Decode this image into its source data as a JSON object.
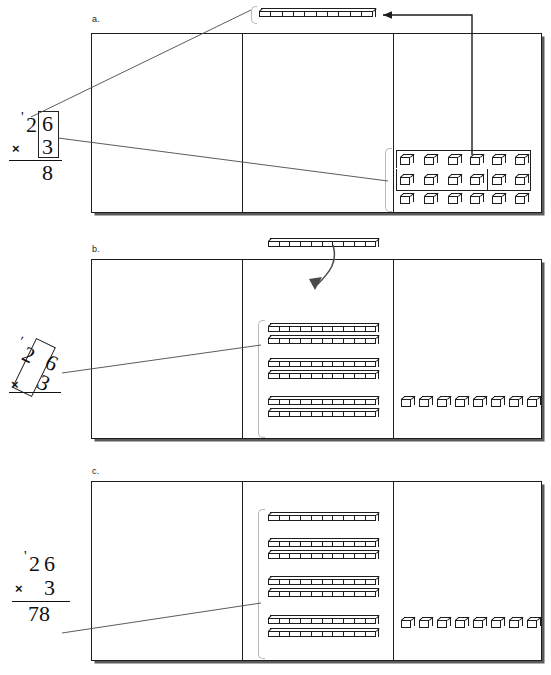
{
  "figure": {
    "ink_color": "#1d1d1d",
    "shadow_color": "#5b5b5b",
    "brace_color": "#b9b9b9"
  },
  "panels": [
    {
      "id": "a",
      "label": "a.",
      "math": {
        "regroup_mark": "'",
        "tens_digit": "2",
        "ones_digit": "6",
        "operator": "×",
        "multiplier": "3",
        "product": "8",
        "highlight": "ones-column-box"
      },
      "mat": {
        "columns": [
          "hundreds",
          "tens",
          "ones"
        ],
        "hundreds_contents": [],
        "tens_contents": [],
        "ones_contents": {
          "type": "cubes",
          "rows": 3,
          "per_row": 6,
          "total": 18,
          "regrouped_ring_count": 10
        }
      },
      "regrouped_rod": {
        "type": "rod",
        "units": 10,
        "position": "above-mat-tens-column",
        "label": "ten ones traded for one ten"
      },
      "arrow": {
        "kind": "elbow-arrow",
        "direction": "left",
        "meaning": "10 ones regrouped to 1 ten"
      }
    },
    {
      "id": "b",
      "label": "b.",
      "math": {
        "regroup_mark": "'",
        "tens_digit": "2",
        "ones_digit": "6",
        "operator": "×",
        "multiplier": "3",
        "product": "",
        "highlight": "tens-column-tilted-box"
      },
      "mat": {
        "columns": [
          "hundreds",
          "tens",
          "ones"
        ],
        "hundreds_contents": [],
        "tens_contents": {
          "type": "rods",
          "groups": [
            2,
            2,
            2
          ],
          "total": 6,
          "units_each": 10
        },
        "ones_contents": {
          "type": "cubes",
          "rows": 1,
          "per_row": 8,
          "total": 8
        }
      },
      "regrouped_rod": {
        "type": "rod",
        "units": 10,
        "position": "above-mat-tens-column",
        "label": "carried ten"
      },
      "arrow": {
        "kind": "curved-arrow",
        "direction": "down",
        "meaning": "carried ten joins the tens column"
      }
    },
    {
      "id": "c",
      "label": "c.",
      "math": {
        "regroup_mark": "'",
        "tens_digit": "2",
        "ones_digit": "6",
        "operator": "×",
        "multiplier": "3",
        "product": "78",
        "highlight": "none"
      },
      "mat": {
        "columns": [
          "hundreds",
          "tens",
          "ones"
        ],
        "hundreds_contents": [],
        "tens_contents": {
          "type": "rods",
          "groups": [
            1,
            2,
            2,
            2
          ],
          "total": 7,
          "units_each": 10
        },
        "ones_contents": {
          "type": "cubes",
          "rows": 1,
          "per_row": 8,
          "total": 8
        }
      },
      "regrouped_rod": null,
      "arrow": null
    }
  ]
}
